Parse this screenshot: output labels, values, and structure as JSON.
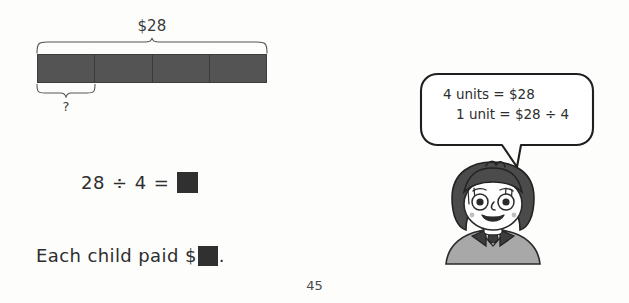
{
  "page": {
    "number": "45",
    "background_color": "#fdfdfc"
  },
  "bar_model": {
    "name": "bar-model-diagram",
    "total_label": "$28",
    "unknown_label": "?",
    "unit_count": 4,
    "bar_fill_color": "#545454",
    "bar_border_color": "#3d3d3d",
    "top_brace_spans_units": 4,
    "bottom_brace_spans_units": 1
  },
  "equation": {
    "dividend": "28",
    "divide_symbol": "÷",
    "divisor": "4",
    "equals": "=",
    "answer_box": "",
    "answer_box_color": "#303030"
  },
  "sentence": {
    "text_before": "Each child paid $",
    "answer_box": "",
    "text_after": "."
  },
  "speech_bubble": {
    "name": "speech-bubble",
    "line_1": "4 units = $28",
    "line_2": "1 unit = $28 ÷ 4",
    "stroke_color": "#1f1f1f",
    "fill_color": "#ffffff"
  },
  "character": {
    "name": "child-illustration",
    "description": "cartoon child",
    "hair_color": "#4b4b4b",
    "skin_color": "#ffffff",
    "shirt_color": "#9a9a9a"
  }
}
